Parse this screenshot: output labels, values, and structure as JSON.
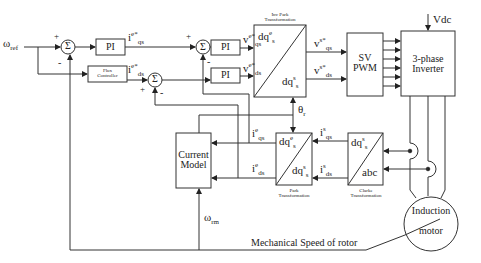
{
  "diagram": {
    "inputs": {
      "speed_ref": {
        "symbol": "ω",
        "sub": "ref"
      },
      "vdc": "Vdc"
    },
    "blocks": {
      "sum1": "Σ",
      "sum2": "Σ",
      "sum3": "Σ",
      "pi_speed": "PI",
      "pi_q": "PI",
      "pi_d": "PI",
      "flux_controller": [
        "Flux",
        "Controller"
      ],
      "inv_park": {
        "caption": [
          "Inv Park",
          "Transformation"
        ],
        "top": "dq",
        "top_sub": "s",
        "top_sup": "e",
        "bottom": "dq",
        "bottom_sub": "s",
        "bottom_sup": "s"
      },
      "sv_pwm": [
        "SV",
        "PWM"
      ],
      "inverter": [
        "3-phase",
        "Inverter"
      ],
      "current_model": [
        "Current",
        "Model"
      ],
      "park": {
        "caption": [
          "Park",
          "Transformation"
        ],
        "top": "dq",
        "top_sub": "s",
        "top_sup": "e",
        "bottom": "dq",
        "bottom_sub": "s",
        "bottom_sup": "s"
      },
      "clarke": {
        "caption": [
          "Clarke",
          "Transformation"
        ],
        "top": "dq",
        "top_sub": "s",
        "top_sup": "s",
        "bottom": "abc"
      },
      "motor": [
        "Induction",
        "motor"
      ]
    },
    "signals": {
      "iqs_ref": {
        "base": "i",
        "sub": "qs",
        "sup": "e*"
      },
      "ids_ref": {
        "base": "i",
        "sub": "ds",
        "sup": "e*"
      },
      "vqs_e": {
        "base": "v",
        "sub": "qs",
        "sup": "e*"
      },
      "vds_e": {
        "base": "v",
        "sub": "ds",
        "sup": "e*"
      },
      "vqs_s": {
        "base": "v",
        "sub": "qs",
        "sup": "s*"
      },
      "vds_s": {
        "base": "v",
        "sub": "ds",
        "sup": "s*"
      },
      "iqs_e": {
        "base": "i",
        "sub": "qs",
        "sup": "e"
      },
      "ids_e": {
        "base": "i",
        "sub": "ds",
        "sup": "e"
      },
      "iqs_s": {
        "base": "i",
        "sub": "qs",
        "sup": "s"
      },
      "ids_s": {
        "base": "i",
        "sub": "ds",
        "sup": "s"
      },
      "theta": {
        "base": "θ",
        "sub": "r"
      },
      "omega_rm": {
        "base": "ω",
        "sub": "rm"
      },
      "mech_speed": "Mechanical Speed of rotor"
    },
    "signs": {
      "sum1_plus": "+",
      "sum1_minus": "-",
      "sum2_plus": "+",
      "sum2_minus": "-",
      "sum3_plus": "+",
      "sum3_minus": "-"
    }
  }
}
